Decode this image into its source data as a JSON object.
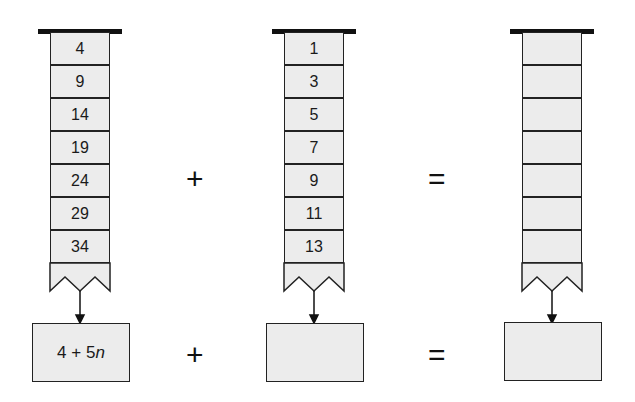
{
  "columns": [
    {
      "name": "sequence-a",
      "values": [
        "4",
        "9",
        "14",
        "19",
        "24",
        "29",
        "34"
      ],
      "formula": "4 + 5n"
    },
    {
      "name": "sequence-b",
      "values": [
        "1",
        "3",
        "5",
        "7",
        "9",
        "11",
        "13"
      ],
      "formula": ""
    },
    {
      "name": "sequence-sum",
      "values": [
        "",
        "",
        "",
        "",
        "",
        "",
        ""
      ],
      "formula": ""
    }
  ],
  "operators": {
    "plus": "+",
    "equals": "="
  },
  "colors": {
    "cell_fill": "#ececec",
    "stroke": "#222222"
  }
}
